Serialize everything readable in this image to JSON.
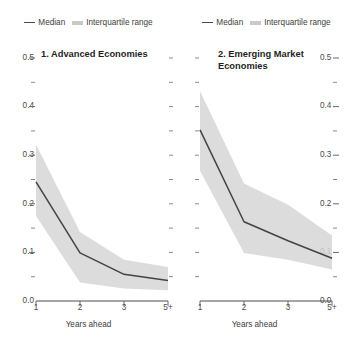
{
  "legend": {
    "median_label": "Median",
    "iqr_label": "Interquartile range",
    "median_color": "#4a4a4a",
    "iqr_color": "#c9c9c9"
  },
  "axis": {
    "xlabel": "Years ahead",
    "xticks": [
      "1",
      "2",
      "3",
      "5+"
    ],
    "yticks": [
      "0.5",
      "0.4",
      "0.3",
      "0.2",
      "0.1",
      "0.0"
    ],
    "ylim": [
      0.0,
      0.5
    ],
    "ytick_step": 0.1,
    "yminor_step": 0.05,
    "grid": "off"
  },
  "chart_data": [
    {
      "type": "line",
      "panel": 1,
      "title": "1. Advanced Economies",
      "xlabel": "Years ahead",
      "ylabel": "",
      "ylim": [
        0.0,
        0.5
      ],
      "x": [
        "1",
        "2",
        "3",
        "5+"
      ],
      "series": [
        {
          "name": "Median",
          "values": [
            0.245,
            0.099,
            0.055,
            0.042
          ]
        },
        {
          "name": "Interquartile range upper",
          "values": [
            0.322,
            0.142,
            0.085,
            0.07
          ]
        },
        {
          "name": "Interquartile range lower",
          "values": [
            0.175,
            0.038,
            0.026,
            0.022
          ]
        }
      ],
      "legend_position": "top-center",
      "grid": "off"
    },
    {
      "type": "line",
      "panel": 2,
      "title": "2. Emerging Market Economies",
      "xlabel": "Years ahead",
      "ylabel": "",
      "ylim": [
        0.0,
        0.5
      ],
      "x": [
        "1",
        "2",
        "3",
        "5+"
      ],
      "series": [
        {
          "name": "Median",
          "values": [
            0.352,
            0.163,
            0.124,
            0.088
          ]
        },
        {
          "name": "Interquartile range upper",
          "values": [
            0.432,
            0.242,
            0.198,
            0.135
          ]
        },
        {
          "name": "Interquartile range lower",
          "values": [
            0.268,
            0.099,
            0.085,
            0.065
          ]
        }
      ],
      "legend_position": "top-center",
      "grid": "off"
    }
  ],
  "panels": {
    "left": {
      "title": "1. Advanced Economies",
      "xlabel": "Years ahead"
    },
    "right": {
      "title": "2. Emerging Market Economies",
      "xlabel": "Years ahead"
    }
  }
}
